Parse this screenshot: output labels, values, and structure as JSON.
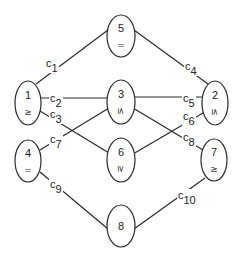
{
  "diagram": {
    "width": 243,
    "height": 261,
    "nodes": [
      {
        "id": "1",
        "label": "1",
        "op": "≥",
        "cx": 28,
        "cy": 103,
        "rx": 13,
        "ry": 22,
        "rotate": 0
      },
      {
        "id": "2",
        "label": "2",
        "op": "≤",
        "cx": 215,
        "cy": 103,
        "rx": 13,
        "ry": 22,
        "rotate": 90
      },
      {
        "id": "3",
        "label": "3",
        "op": "≤",
        "cx": 121,
        "cy": 102,
        "rx": 14,
        "ry": 22,
        "rotate": 90
      },
      {
        "id": "4",
        "label": "4",
        "op": "=",
        "cx": 28,
        "cy": 161,
        "rx": 13,
        "ry": 21,
        "rotate": 0
      },
      {
        "id": "5",
        "label": "5",
        "op": "=",
        "cx": 121,
        "cy": 36,
        "rx": 14,
        "ry": 21,
        "rotate": 0
      },
      {
        "id": "6",
        "label": "6",
        "op": "≥",
        "cx": 121,
        "cy": 160,
        "rx": 14,
        "ry": 22,
        "rotate": 90
      },
      {
        "id": "7",
        "label": "7",
        "op": "≥",
        "cx": 214,
        "cy": 160,
        "rx": 13,
        "ry": 21,
        "rotate": 0
      },
      {
        "id": "8",
        "label": "8",
        "op": "",
        "cx": 121,
        "cy": 226,
        "rx": 14,
        "ry": 21,
        "rotate": 0
      }
    ],
    "edges": [
      {
        "from": "1",
        "to": "5",
        "label": "c",
        "sub": "1",
        "x1": 36,
        "y1": 84,
        "x2": 108,
        "y2": 30,
        "lx": 46,
        "ly": 67
      },
      {
        "from": "5",
        "to": "2",
        "label": "c",
        "sub": "4",
        "x1": 134,
        "y1": 30,
        "x2": 208,
        "y2": 84,
        "lx": 185,
        "ly": 70
      },
      {
        "from": "1",
        "to": "3",
        "label": "c",
        "sub": "2",
        "x1": 41,
        "y1": 98,
        "x2": 107,
        "y2": 98,
        "lx": 50,
        "ly": 102
      },
      {
        "from": "3",
        "to": "2",
        "label": "c",
        "sub": "5",
        "x1": 135,
        "y1": 97,
        "x2": 202,
        "y2": 97,
        "lx": 183,
        "ly": 102
      },
      {
        "from": "1",
        "to": "6",
        "label": "c",
        "sub": "3",
        "x1": 40,
        "y1": 111,
        "x2": 109,
        "y2": 153,
        "lx": 50,
        "ly": 118
      },
      {
        "from": "4",
        "to": "3",
        "label": "c",
        "sub": "7",
        "x1": 40,
        "y1": 150,
        "x2": 109,
        "y2": 108,
        "lx": 50,
        "ly": 143
      },
      {
        "from": "3",
        "to": "7",
        "label": "c",
        "sub": "8",
        "x1": 133,
        "y1": 108,
        "x2": 203,
        "y2": 150,
        "lx": 183,
        "ly": 141
      },
      {
        "from": "6",
        "to": "2",
        "label": "c",
        "sub": "6",
        "x1": 133,
        "y1": 154,
        "x2": 203,
        "y2": 113,
        "lx": 183,
        "ly": 120
      },
      {
        "from": "4",
        "to": "8",
        "label": "c",
        "sub": "9",
        "x1": 40,
        "y1": 172,
        "x2": 108,
        "y2": 229,
        "lx": 50,
        "ly": 188
      },
      {
        "from": "8",
        "to": "7",
        "label": "c",
        "sub": "10",
        "x1": 134,
        "y1": 229,
        "x2": 205,
        "y2": 178,
        "lx": 178,
        "ly": 199
      }
    ]
  }
}
